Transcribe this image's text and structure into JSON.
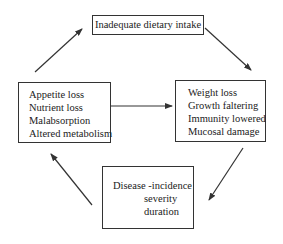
{
  "diagram": {
    "nodes": {
      "top": {
        "lines": [
          "Inadequate dietary intake"
        ]
      },
      "left": {
        "lines": [
          "Appetite loss",
          "Nutrient loss",
          "Malabsorption",
          "Altered metabolism"
        ]
      },
      "right": {
        "lines": [
          "Weight loss",
          "Growth faltering",
          "Immunity lowered",
          "Mucosal damage"
        ]
      },
      "bottom": {
        "lines": [
          "Disease -incidence",
          "severity",
          "duration"
        ]
      }
    },
    "edges": [
      {
        "from": "left",
        "to": "top"
      },
      {
        "from": "top",
        "to": "right"
      },
      {
        "from": "left",
        "to": "right"
      },
      {
        "from": "right",
        "to": "bottom"
      },
      {
        "from": "bottom",
        "to": "left"
      }
    ],
    "colors": {
      "stroke": "#333333",
      "text": "#222222",
      "background": "#ffffff"
    }
  }
}
